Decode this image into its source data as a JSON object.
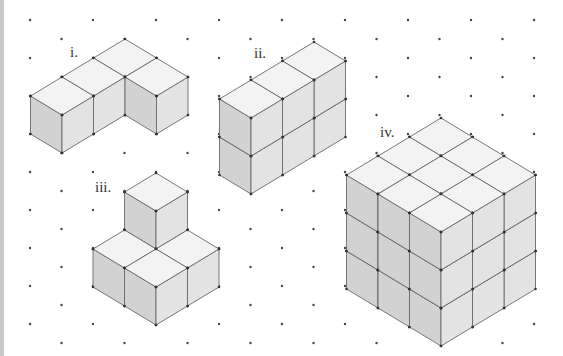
{
  "diagram": {
    "colors": {
      "background": "#ffffff",
      "dot": "#444444",
      "edge": "#6a6a6a",
      "vertex": "#333333",
      "top_face": "#f3f3f3",
      "left_face": "#d2d2d2",
      "right_face": "#e3e3e3",
      "strip": "#c8c8c8"
    },
    "grid": {
      "origin": [
        30,
        20
      ],
      "col_spacing": 31.5,
      "row_spacing": 38,
      "cols": 17,
      "rows": 9
    },
    "iso": {
      "dx": 31.5,
      "dy": 19,
      "dz": 38
    },
    "shapes": [
      {
        "id": "i",
        "label": "i.",
        "label_pos": [
          70,
          45
        ],
        "origin": [
          125,
          39
        ],
        "top_height": 1,
        "cubes": [
          [
            0,
            0,
            0
          ],
          [
            0,
            1,
            0
          ],
          [
            0,
            2,
            0
          ],
          [
            1,
            0,
            0
          ]
        ]
      },
      {
        "id": "ii",
        "label": "ii.",
        "label_pos": [
          254,
          46
        ],
        "origin": [
          314,
          42
        ],
        "top_height": 2,
        "cubes": [
          [
            0,
            0,
            0
          ],
          [
            0,
            1,
            0
          ],
          [
            0,
            2,
            0
          ],
          [
            0,
            0,
            1
          ],
          [
            0,
            1,
            1
          ],
          [
            0,
            2,
            1
          ]
        ]
      },
      {
        "id": "iii",
        "label": "iii.",
        "label_pos": [
          95,
          180
        ],
        "origin": [
          156,
          173
        ],
        "top_height": 2,
        "cubes": [
          [
            0,
            0,
            0
          ],
          [
            1,
            0,
            0
          ],
          [
            0,
            1,
            0
          ],
          [
            1,
            1,
            0
          ],
          [
            0,
            0,
            1
          ]
        ]
      },
      {
        "id": "iv",
        "label": "iv.",
        "label_pos": [
          380,
          125
        ],
        "origin": [
          441,
          118
        ],
        "top_height": 3,
        "cubes": "3x3x3"
      }
    ]
  }
}
